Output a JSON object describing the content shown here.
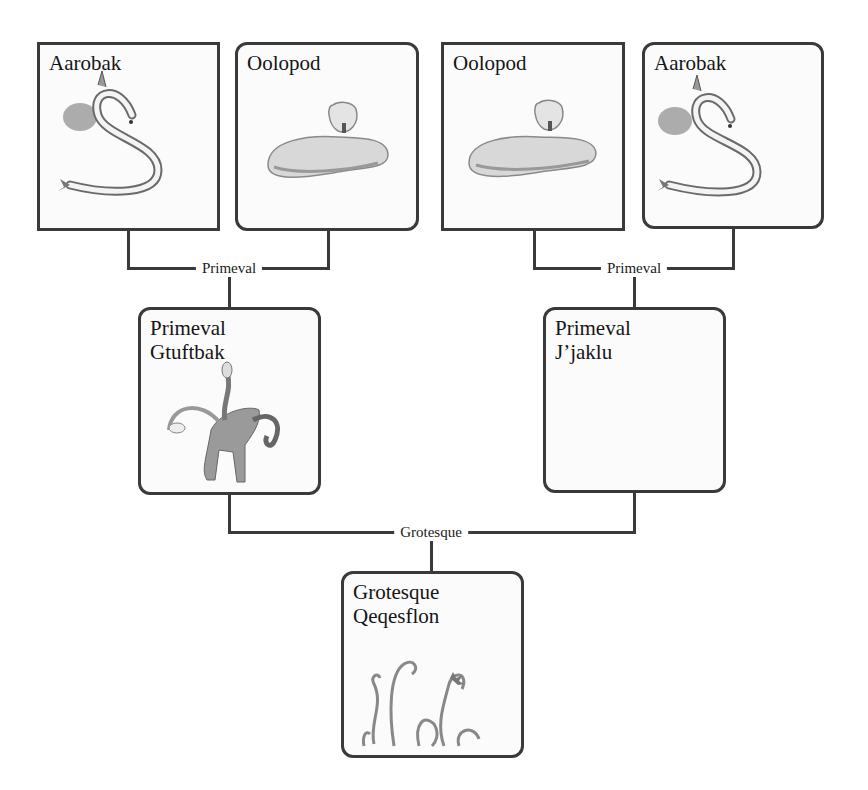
{
  "diagram": {
    "type": "breeding-tree",
    "generation_1": [
      {
        "name": "Aarobak",
        "art": "serpent-eel-icon",
        "corner": "square"
      },
      {
        "name": "Oolopod",
        "art": "sleeping-beast-icon",
        "corner": "rounded"
      },
      {
        "name": "Oolopod",
        "art": "sleeping-beast-icon",
        "corner": "square"
      },
      {
        "name": "Aarobak",
        "art": "serpent-eel-icon",
        "corner": "rounded"
      }
    ],
    "generation_2": [
      {
        "name": "Primeval\nGtuftbak",
        "art": "multi-headed-beast-icon"
      },
      {
        "name": "Primeval\nJ’jaklu",
        "art": ""
      }
    ],
    "generation_3": [
      {
        "name": "Grotesque\nQeqesflon",
        "art": "tentacles-icon"
      }
    ],
    "connectors": {
      "left_pair": "Primeval",
      "right_pair": "Primeval",
      "final": "Grotesque"
    }
  }
}
